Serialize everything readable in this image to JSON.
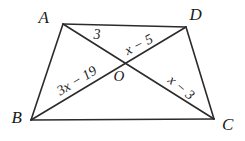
{
  "figure": {
    "type": "geometry-diagram",
    "shape": "quadrilateral-with-diagonals",
    "vertices": [
      {
        "name": "A",
        "label": "A",
        "x": 63,
        "y": 24,
        "label_x": 44,
        "label_y": 17
      },
      {
        "name": "D",
        "label": "D",
        "x": 186,
        "y": 27,
        "label_x": 196,
        "label_y": 14
      },
      {
        "name": "B",
        "label": "B",
        "x": 31,
        "y": 120,
        "label_x": 17,
        "label_y": 117
      },
      {
        "name": "C",
        "label": "C",
        "x": 214,
        "y": 119,
        "label_x": 228,
        "label_y": 124
      }
    ],
    "intersection": {
      "name": "O",
      "label": "O",
      "x": 119,
      "y": 61,
      "label_x": 119,
      "label_y": 76
    },
    "sides": [
      {
        "name": "AD",
        "from": "A",
        "to": "D"
      },
      {
        "name": "AB",
        "from": "A",
        "to": "B"
      },
      {
        "name": "BC",
        "from": "B",
        "to": "C"
      },
      {
        "name": "DC",
        "from": "D",
        "to": "C"
      }
    ],
    "diagonals": [
      {
        "name": "AC",
        "from": "A",
        "to": "C"
      },
      {
        "name": "BD",
        "from": "B",
        "to": "D"
      }
    ],
    "segment_labels": [
      {
        "name": "AO",
        "text": "3",
        "x": 97,
        "y": 35,
        "rotation": 0
      },
      {
        "name": "OD",
        "text": "x − 5",
        "x": 139,
        "y": 45,
        "rotation": -27
      },
      {
        "name": "BO",
        "text": "3x − 19",
        "x": 77,
        "y": 81,
        "rotation": -31
      },
      {
        "name": "OC",
        "text": "x − 3",
        "x": 181,
        "y": 88,
        "rotation": 40
      }
    ],
    "style": {
      "stroke": "#2b2b2b",
      "stroke_width": 1.6,
      "background": "#ffffff",
      "text_color": "#1a1a1a"
    }
  }
}
